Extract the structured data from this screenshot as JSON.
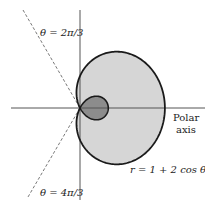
{
  "figure": {
    "curve_equation": "r = 1 + 2 cos θ",
    "axis_label_line1": "Polar",
    "axis_label_line2": "axis",
    "line_upper_label": "θ = 2π/3",
    "line_lower_label": "θ = 4π/3"
  },
  "colors": {
    "outer_fill": "#d6d6d6",
    "inner_loop_fill": "#8c8c8c",
    "curve_stroke": "#1a1a1a",
    "axis_stroke": "#555555",
    "dashed_stroke": "#555555"
  },
  "geometry": {
    "origin": [
      80,
      108
    ],
    "scale_x": 28.3,
    "scale_y": 32,
    "a": 1,
    "b": 2
  }
}
